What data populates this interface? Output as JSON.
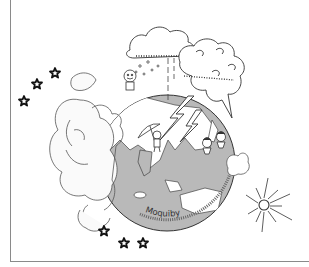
{
  "illustration": {
    "description": "Hand-drawn line illustration of Earth globe with clouds, rain, lightning, small characters, stars and a sun",
    "top_caption": "· · · ·",
    "arc_signature": "Moquiby",
    "colors": {
      "ocean": "#b9b9b9",
      "land": "#ffffff",
      "line": "#333333",
      "border": "#8a8a8a",
      "background": "#ffffff"
    },
    "stars": [
      {
        "x": 55,
        "y": 73
      },
      {
        "x": 37,
        "y": 84
      },
      {
        "x": 24,
        "y": 101
      },
      {
        "x": 104,
        "y": 231
      },
      {
        "x": 124,
        "y": 243
      },
      {
        "x": 143,
        "y": 243
      }
    ],
    "sun": {
      "x": 264,
      "y": 205
    }
  }
}
